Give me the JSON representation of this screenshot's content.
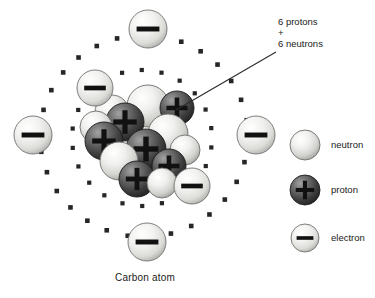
{
  "diagram": {
    "caption": "Carbon atom",
    "annotation": {
      "line1": "6 protons",
      "line2": "+",
      "line3": "6 neutrons",
      "leader_from": [
        276,
        52
      ],
      "leader_to": [
        176,
        110
      ]
    },
    "colors": {
      "background": "#ffffff",
      "text": "#1a1a1a",
      "neutron_light": "#f4f4f2",
      "neutron_mid": "#d9d9d6",
      "neutron_dark": "#9a9a98",
      "neutron_stroke": "#6e6e6c",
      "proton_light": "#8c8c8c",
      "proton_mid": "#595959",
      "proton_dark": "#2a2a2a",
      "proton_stroke": "#1c1c1c",
      "electron_light": "#f6f6f4",
      "electron_mid": "#dedede",
      "electron_dark": "#a8a8a6",
      "electron_stroke": "#707070",
      "glyph": "#111111",
      "orbit_dot": "#262626",
      "leader": "#2a2a2a"
    },
    "nucleus": {
      "center": [
        140,
        140
      ],
      "proton_count": 6,
      "neutron_count": 6,
      "particle_radius": 19,
      "protons": [
        {
          "cx": 125,
          "cy": 122,
          "r": 19,
          "glyph": "+"
        },
        {
          "cx": 104,
          "cy": 141,
          "r": 19,
          "glyph": "+"
        },
        {
          "cx": 146,
          "cy": 149,
          "r": 20,
          "glyph": "+"
        },
        {
          "cx": 169,
          "cy": 166,
          "r": 17,
          "glyph": "+"
        },
        {
          "cx": 137,
          "cy": 179,
          "r": 18,
          "glyph": "+"
        },
        {
          "cx": 177,
          "cy": 108,
          "r": 17,
          "glyph": "+"
        }
      ],
      "neutrons": [
        {
          "cx": 148,
          "cy": 106,
          "r": 21
        },
        {
          "cx": 112,
          "cy": 112,
          "r": 17
        },
        {
          "cx": 168,
          "cy": 134,
          "r": 20
        },
        {
          "cx": 119,
          "cy": 161,
          "r": 19
        },
        {
          "cx": 96,
          "cy": 127,
          "r": 16
        },
        {
          "cx": 162,
          "cy": 183,
          "r": 15
        },
        {
          "cx": 185,
          "cy": 150,
          "r": 15
        }
      ]
    },
    "shells": [
      {
        "name": "inner-shell",
        "cx": 142,
        "cy": 138,
        "rx": 70,
        "ry": 68,
        "dot_count": 22,
        "dot_size": 4.2,
        "start_angle": 8
      },
      {
        "name": "outer-shell",
        "cx": 144,
        "cy": 136,
        "rx": 104,
        "ry": 101,
        "dot_count": 30,
        "dot_size": 4.6,
        "start_angle": 3
      }
    ],
    "electrons": [
      {
        "name": "electron-inner-upper-left",
        "cx": 95,
        "cy": 88,
        "r": 18,
        "shell": "inner"
      },
      {
        "name": "electron-inner-lower-right",
        "cx": 192,
        "cy": 186,
        "r": 18,
        "shell": "inner"
      },
      {
        "name": "electron-outer-top",
        "cx": 148,
        "cy": 29,
        "r": 19,
        "shell": "outer"
      },
      {
        "name": "electron-outer-left",
        "cx": 33,
        "cy": 135,
        "r": 19,
        "shell": "outer"
      },
      {
        "name": "electron-outer-right",
        "cx": 256,
        "cy": 135,
        "r": 19,
        "shell": "outer"
      },
      {
        "name": "electron-outer-bottom",
        "cx": 147,
        "cy": 242,
        "r": 19,
        "shell": "outer"
      }
    ],
    "legend": {
      "items": [
        {
          "name": "neutron",
          "label": "neutron",
          "type": "neutron",
          "cx": 305,
          "cy": 145,
          "r": 15,
          "glyph": ""
        },
        {
          "name": "proton",
          "label": "proton",
          "type": "proton",
          "cx": 305,
          "cy": 190,
          "r": 15,
          "glyph": "+"
        },
        {
          "name": "electron",
          "label": "electron",
          "type": "electron",
          "cx": 305,
          "cy": 238,
          "r": 14,
          "glyph": "-"
        }
      ],
      "label_x": 331
    }
  }
}
